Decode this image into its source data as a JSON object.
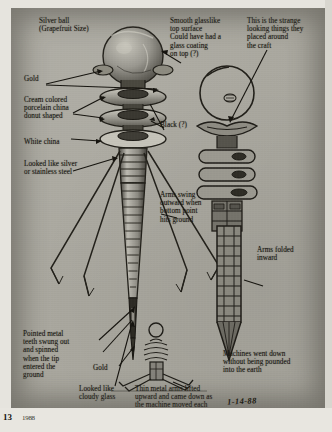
{
  "page": {
    "number": "13",
    "footer_note": "1988",
    "background_color": "#aaa89f",
    "ink_color": "#17150f"
  },
  "labels": {
    "silver_ball": "Silver ball\n(Grapefruit Size)",
    "gold_top": "Gold",
    "cream_china": "Cream colored\nporcelain china\ndonut shaped",
    "white_china": "White china",
    "stainless": "Looked like silver\nor stainless steel",
    "smooth_glass": "Smooth glasslike\ntop surface\nCould have had a\nglass coating\non top (?)",
    "black_q": "Black (?)",
    "strange_things": "This is the strange\nlooking things they\nplaced around\nthe craft",
    "arms_swing": "Arms swing\noutward when\nbottom point\nhits ground",
    "arms_folded": "Arms folded\ninward",
    "pointed_teeth": "Pointed metal\nteeth swung out\nand spinned\nwhen the tip\nentered the\nground",
    "gold_bottom": "Gold",
    "cloudy_glass": "Looked like\ncloudy glass",
    "thin_arms": "Thin metal arms lifted\nupward and came down as\nthe machine moved each\ntime downward",
    "machines_down": "Machines went down\nwithout being pounded\ninto the earth"
  },
  "signature": {
    "date": "1-14-88",
    "credit": "© Betty Ann Luca"
  },
  "figures": {
    "left": "exploded-probe-with-legs",
    "center": "strange-device-full-view",
    "right": "probe-arms-folded",
    "bottom_center": "probe-planted-in-ground"
  }
}
